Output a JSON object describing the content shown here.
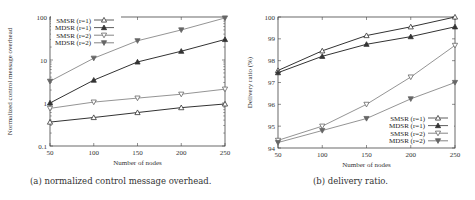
{
  "chart_data": [
    {
      "type": "line",
      "title": "",
      "caption": "(a) normalized control message overhead.",
      "xlabel": "Number of nodes",
      "ylabel": "Normalized control message overhead",
      "yscale": "log",
      "ylim": [
        0.1,
        100
      ],
      "xlim": [
        50,
        250
      ],
      "x": [
        50,
        100,
        150,
        200,
        250
      ],
      "xticks": [
        "50",
        "100",
        "150",
        "200",
        "250"
      ],
      "yticks": [
        "0.1",
        "1",
        "10",
        "100"
      ],
      "legend_position": "upper left",
      "grid": false,
      "series": [
        {
          "name": "SMSR (r=1)",
          "marker": "triangle-up-open",
          "values": [
            0.36,
            0.46,
            0.6,
            0.78,
            0.95
          ]
        },
        {
          "name": "MDSR (r=1)",
          "marker": "triangle-up-filled",
          "values": [
            1.0,
            3.4,
            9.0,
            16.0,
            30.0
          ]
        },
        {
          "name": "SMSR (r=2)",
          "marker": "triangle-down-open",
          "values": [
            0.75,
            1.05,
            1.3,
            1.6,
            2.1
          ]
        },
        {
          "name": "MDSR (r=2)",
          "marker": "triangle-down-filled",
          "values": [
            3.2,
            11.0,
            28.0,
            50.0,
            95.0
          ]
        }
      ]
    },
    {
      "type": "line",
      "title": "",
      "caption": "(b) delivery ratio.",
      "xlabel": "Number of nodes",
      "ylabel": "Delivery ratio (%)",
      "yscale": "linear",
      "ylim": [
        94,
        100
      ],
      "xlim": [
        50,
        250
      ],
      "x": [
        50,
        100,
        150,
        200,
        250
      ],
      "xticks": [
        "50",
        "100",
        "150",
        "200",
        "250"
      ],
      "yticks": [
        "94",
        "95",
        "96",
        "97",
        "98",
        "99",
        "100"
      ],
      "legend_position": "lower right",
      "grid": false,
      "series": [
        {
          "name": "SMSR (r=1)",
          "marker": "triangle-up-open",
          "values": [
            97.55,
            98.45,
            99.15,
            99.55,
            100.0
          ]
        },
        {
          "name": "MDSR (r=1)",
          "marker": "triangle-up-filled",
          "values": [
            97.45,
            98.2,
            98.75,
            99.1,
            99.55
          ]
        },
        {
          "name": "SMSR (r=2)",
          "marker": "triangle-down-open",
          "values": [
            94.35,
            95.0,
            96.0,
            97.25,
            98.7
          ]
        },
        {
          "name": "MDSR (r=2)",
          "marker": "triangle-down-filled",
          "values": [
            94.25,
            94.8,
            95.35,
            96.25,
            97.0
          ]
        }
      ]
    }
  ],
  "captions": {
    "a": "(a) normalized control message overhead.",
    "b": "(b) delivery ratio."
  },
  "colors": {
    "r1": "#333333",
    "r2": "#666666",
    "axis": "#444444"
  }
}
